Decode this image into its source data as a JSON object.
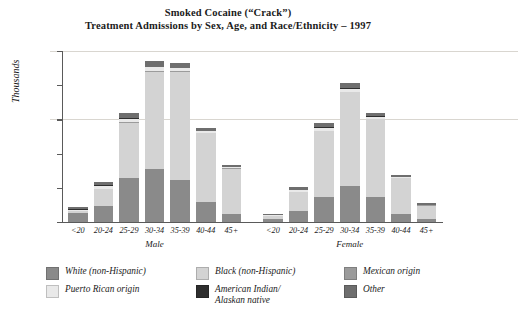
{
  "chart_data": {
    "type": "bar",
    "subtype": "stacked-bar",
    "title": "Smoked Cocaine (“Crack”)",
    "subtitle": "Treatment Admissions by Sex, Age, and Race/Ethnicity – 1997",
    "xlabel": "",
    "ylabel": "Thousands",
    "ylim": [
      0,
      25
    ],
    "yticks": [
      0,
      5,
      10,
      15,
      20,
      25
    ],
    "grid": true,
    "legend_position": "bottom",
    "groups": [
      {
        "name": "Male",
        "categories": [
          "<20",
          "20-24",
          "25-29",
          "30-34",
          "35-39",
          "40-44",
          "45+"
        ]
      },
      {
        "name": "Female",
        "categories": [
          "<20",
          "20-24",
          "25-29",
          "30-34",
          "35-39",
          "40-44",
          "45+"
        ]
      }
    ],
    "categories": [
      "<20",
      "20-24",
      "25-29",
      "30-34",
      "35-39",
      "40-44",
      "45+",
      "<20",
      "20-24",
      "25-29",
      "30-34",
      "35-39",
      "40-44",
      "45+"
    ],
    "series": [
      {
        "name": "White (non-Hispanic)",
        "color": "#8a8a8a",
        "values": [
          1.3,
          2.4,
          6.5,
          7.7,
          6.2,
          2.9,
          1.2,
          0.5,
          1.6,
          3.6,
          5.2,
          3.7,
          1.2,
          0.4
        ]
      },
      {
        "name": "Black (non-Hispanic)",
        "color": "#d3d3d3",
        "values": [
          0.3,
          2.4,
          8.0,
          14.3,
          15.8,
          10.1,
          6.6,
          0.4,
          2.8,
          9.7,
          13.8,
          11.3,
          5.2,
          2.0
        ]
      },
      {
        "name": "Mexican origin",
        "color": "#9b9b9b",
        "values": [
          0.05,
          0.06,
          0.07,
          0.08,
          0.07,
          0.05,
          0.03,
          0.03,
          0.05,
          0.06,
          0.07,
          0.06,
          0.04,
          0.02
        ]
      },
      {
        "name": "Puerto Rican origin",
        "color": "#e9e9e9",
        "values": [
          0.15,
          0.45,
          0.55,
          0.55,
          0.45,
          0.25,
          0.15,
          0.07,
          0.25,
          0.45,
          0.45,
          0.35,
          0.15,
          0.08
        ]
      },
      {
        "name": "American Indian/\nAlaskan native",
        "color": "#2e2e2e",
        "values": [
          0.04,
          0.05,
          0.06,
          0.07,
          0.06,
          0.04,
          0.03,
          0.02,
          0.04,
          0.05,
          0.06,
          0.05,
          0.03,
          0.02
        ]
      },
      {
        "name": "Other",
        "color": "#6e6e6e",
        "values": [
          0.35,
          0.55,
          0.7,
          0.85,
          0.7,
          0.35,
          0.35,
          0.2,
          0.4,
          0.6,
          0.75,
          0.55,
          0.3,
          0.25
        ]
      }
    ],
    "totals": [
      2.2,
      5.9,
      15.9,
      23.6,
      23.3,
      13.7,
      8.4,
      1.2,
      5.1,
      14.5,
      20.3,
      16.0,
      6.9,
      2.8
    ]
  },
  "legend": {
    "items": [
      {
        "label": "White (non-Hispanic)",
        "color": "#8a8a8a"
      },
      {
        "label": "Black (non-Hispanic)",
        "color": "#d3d3d3"
      },
      {
        "label": "Mexican origin",
        "color": "#9b9b9b"
      },
      {
        "label": "Puerto Rican origin",
        "color": "#e9e9e9"
      },
      {
        "label": "American Indian/",
        "label2": "Alaskan native",
        "color": "#2e2e2e"
      },
      {
        "label": "Other",
        "color": "#6e6e6e"
      }
    ]
  }
}
